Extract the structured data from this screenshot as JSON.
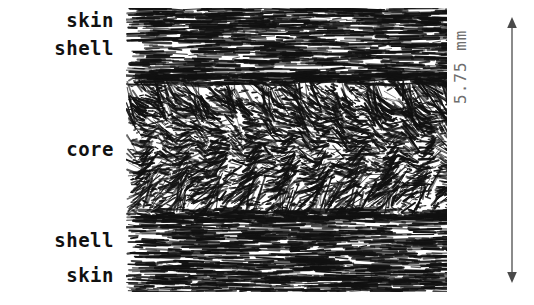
{
  "figure": {
    "kind": "cross-section-micrograph"
  },
  "labels": {
    "skin_top": "skin",
    "shell_top": "shell",
    "core": "core",
    "shell_bottom": "shell",
    "skin_bottom": "skin"
  },
  "dimension": {
    "value": "5.75",
    "unit": "mm",
    "text": "5.75 mm",
    "orientation": "vertical",
    "arrow": "double-headed"
  },
  "colors": {
    "background": "#ffffff",
    "ink": "#111111",
    "dimension_gray": "#6e6e6e"
  },
  "layers": [
    {
      "name": "skin",
      "position": "top",
      "fiber_orientation": "horizontal",
      "band_top_pct": 0,
      "band_bottom_pct": 9
    },
    {
      "name": "shell",
      "position": "top",
      "fiber_orientation": "horizontal",
      "band_top_pct": 9,
      "band_bottom_pct": 25
    },
    {
      "name": "core",
      "position": "middle",
      "fiber_orientation": "wavy-chevron",
      "band_top_pct": 25,
      "band_bottom_pct": 73
    },
    {
      "name": "shell",
      "position": "bottom",
      "fiber_orientation": "horizontal",
      "band_top_pct": 73,
      "band_bottom_pct": 91
    },
    {
      "name": "skin",
      "position": "bottom",
      "fiber_orientation": "horizontal",
      "band_top_pct": 91,
      "band_bottom_pct": 100
    }
  ]
}
